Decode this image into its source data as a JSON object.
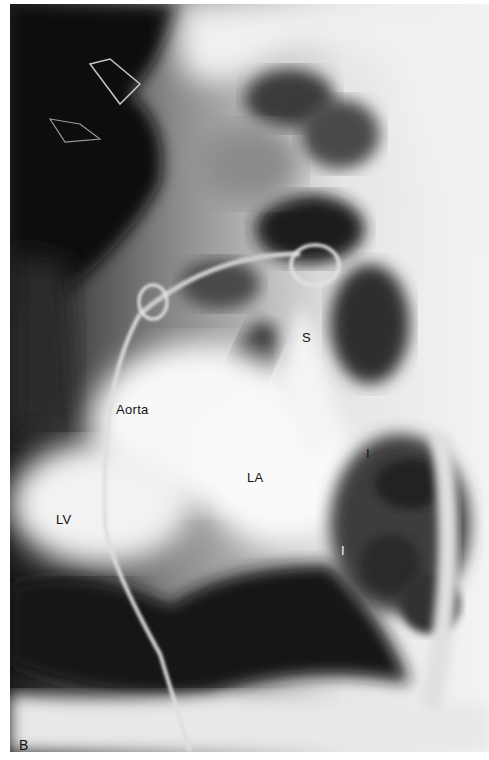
{
  "figure": {
    "panel_label": "B",
    "colors": {
      "dark": "#0c0c0c",
      "mid": "#6a6a6a",
      "light": "#f4f4f4",
      "label_dark": "#111111",
      "label_light": "#f2f2f2"
    }
  },
  "labels": {
    "aorta": {
      "text": "Aorta",
      "x": 116,
      "y": 403
    },
    "la": {
      "text": "LA",
      "x": 247,
      "y": 471
    },
    "lv": {
      "text": "LV",
      "x": 56,
      "y": 513
    },
    "s": {
      "text": "S",
      "x": 302,
      "y": 331
    },
    "i_upper": {
      "text": "I",
      "x": 366,
      "y": 447,
      "tone": "dark"
    },
    "i_lower": {
      "text": "I",
      "x": 341,
      "y": 544,
      "tone": "light"
    },
    "panel": {
      "text": "B",
      "x": 19,
      "y": 738
    }
  }
}
